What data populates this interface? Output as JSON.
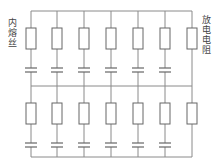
{
  "diagram": {
    "type": "circuit",
    "labels": {
      "fuse_label": "内熔丝",
      "resistor_label": "放电电阻"
    },
    "colors": {
      "line": "#8a8a8a",
      "component": "#666666",
      "text": "#444444"
    },
    "rows": 2,
    "capacitor_columns": 6,
    "resistor_columns": 1,
    "column_x": [
      31,
      57,
      84,
      111,
      138,
      165,
      192
    ],
    "rails_y": [
      11,
      86,
      157
    ]
  }
}
